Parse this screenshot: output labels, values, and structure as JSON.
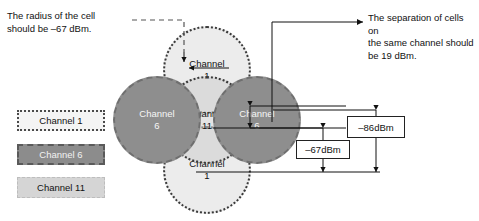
{
  "diagram": {
    "notes": {
      "radius": "The radius of the cell\nshould be –67 dBm.",
      "separation": "The separation of cells on\nthe same channel should\nbe 19 dBm."
    },
    "legend": [
      {
        "label": "Channel 1",
        "color": "#f4f4f4",
        "border": "dotted"
      },
      {
        "label": "Channel 6",
        "color": "#8c8c8c",
        "border": "dashed"
      },
      {
        "label": "Channel 11",
        "color": "#d5d5d5",
        "border": "dashed"
      }
    ],
    "cells": [
      {
        "name": "cell-top",
        "line1": "Channel",
        "line2": "1",
        "channel": 1,
        "color": "#ececec"
      },
      {
        "name": "cell-left",
        "line1": "Channel",
        "line2": "6",
        "channel": 6,
        "color": "#8e8e8e"
      },
      {
        "name": "cell-right",
        "line1": "Channel",
        "line2": "6",
        "channel": 6,
        "color": "#8e8e8e"
      },
      {
        "name": "cell-center",
        "line1": "Channel",
        "line2": "11",
        "channel": 11,
        "color": "#d2d2d2"
      },
      {
        "name": "cell-bottom",
        "line1": "Channel",
        "line2": "1",
        "channel": 1,
        "color": "#ececec"
      }
    ],
    "measurements": [
      {
        "name": "cell-radius-measure",
        "label": "–67dBm"
      },
      {
        "name": "cell-separation-measure",
        "label": "–86dBm"
      }
    ]
  }
}
